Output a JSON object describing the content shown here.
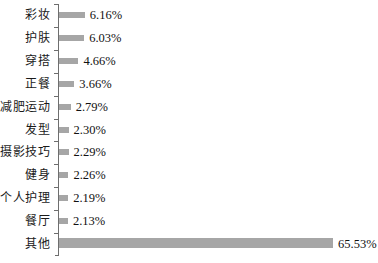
{
  "chart_data": {
    "type": "bar",
    "orientation": "horizontal",
    "title": "",
    "subtitle": "",
    "xlabel": "",
    "ylabel": "",
    "grid": false,
    "legend": null,
    "xlim": [
      0,
      65.53
    ],
    "value_suffix": "%",
    "categories": [
      "彩妆",
      "护肤",
      "穿搭",
      "正餐",
      "减肥运动",
      "发型",
      "摄影技巧",
      "健身",
      "个人护理",
      "餐厅",
      "其他"
    ],
    "values": [
      6.16,
      6.03,
      4.66,
      3.66,
      2.79,
      2.3,
      2.29,
      2.26,
      2.19,
      2.13,
      65.53
    ],
    "labels": [
      "6.16%",
      "6.03%",
      "4.66%",
      "3.66%",
      "2.79%",
      "2.30%",
      "2.29%",
      "2.26%",
      "2.19%",
      "2.13%",
      "65.53%"
    ],
    "colors": {
      "bar": "#a6a6a6",
      "axis": "#6e6e6e",
      "text": "#111111",
      "background": "#ffffff"
    }
  },
  "rows": [
    {
      "category": "彩妆",
      "value_label": "6.16%"
    },
    {
      "category": "护肤",
      "value_label": "6.03%"
    },
    {
      "category": "穿搭",
      "value_label": "4.66%"
    },
    {
      "category": "正餐",
      "value_label": "3.66%"
    },
    {
      "category": "减肥运动",
      "value_label": "2.79%"
    },
    {
      "category": "发型",
      "value_label": "2.30%"
    },
    {
      "category": "摄影技巧",
      "value_label": "2.29%"
    },
    {
      "category": "健身",
      "value_label": "2.26%"
    },
    {
      "category": "个人护理",
      "value_label": "2.19%"
    },
    {
      "category": "餐厅",
      "value_label": "2.13%"
    },
    {
      "category": "其他",
      "value_label": "65.53%"
    }
  ]
}
